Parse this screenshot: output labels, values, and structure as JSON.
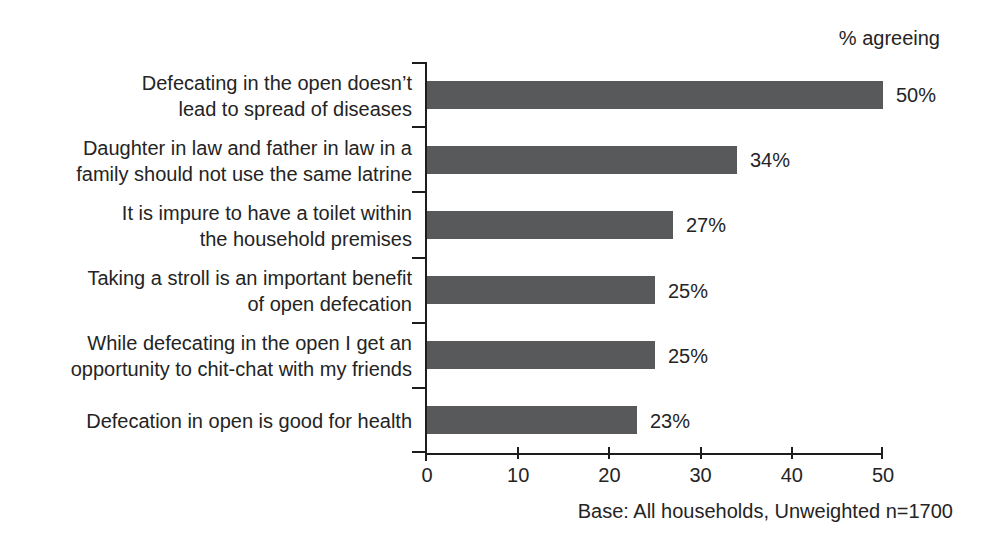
{
  "chart_data": {
    "type": "bar",
    "orientation": "horizontal",
    "title": "% agreeing",
    "footnote": "Base: All households, Unweighted n=1700",
    "bar_color": "#58595b",
    "axis_color": "#1d1d1d",
    "text_color": "#242424",
    "xlim": [
      0,
      50
    ],
    "x_ticks": [
      0,
      10,
      20,
      30,
      40,
      50
    ],
    "grid": false,
    "legend_position": "top-right",
    "categories": [
      "Defecating in the open doesn’t lead to spread of diseases",
      "Daughter in law and father in law in a family should not use the same latrine",
      "It is impure to have a toilet within the household premises",
      "Taking a stroll is an important benefit of open defecation",
      "While defecating in the open I get an opportunity to chit-chat with my friends",
      "Defecation in open is good for health"
    ],
    "category_lines": [
      [
        "Defecating in the open doesn’t",
        "lead to spread of diseases"
      ],
      [
        "Daughter in law and father in law in a",
        "family should not use the same latrine"
      ],
      [
        "It is impure to have a toilet within",
        "the household premises"
      ],
      [
        "Taking a stroll is an important benefit",
        "of open defecation"
      ],
      [
        "While defecating in the open I get an",
        "opportunity to chit-chat with my friends"
      ],
      [
        "Defecation in open is good for health"
      ]
    ],
    "values": [
      50,
      34,
      27,
      25,
      25,
      23
    ],
    "value_labels": [
      "50%",
      "34%",
      "27%",
      "25%",
      "25%",
      "23%"
    ]
  }
}
